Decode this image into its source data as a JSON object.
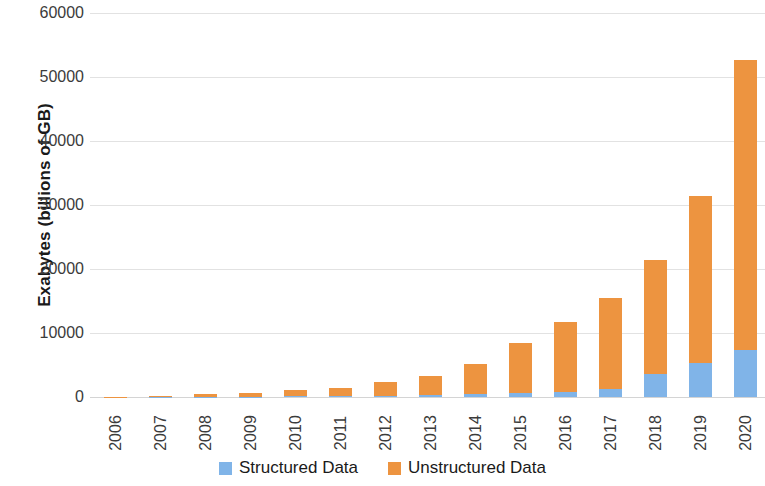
{
  "chart_data": {
    "type": "bar",
    "subtype": "stacked",
    "title": "",
    "xlabel": "",
    "ylabel": "Exabytes (billions of GB)",
    "categories": [
      "2006",
      "2007",
      "2008",
      "2009",
      "2010",
      "2011",
      "2012",
      "2013",
      "2014",
      "2015",
      "2016",
      "2017",
      "2018",
      "2019",
      "2020"
    ],
    "series": [
      {
        "name": "Structured Data",
        "color": "#80b4e8",
        "values": [
          10,
          25,
          50,
          80,
          120,
          170,
          230,
          300,
          400,
          550,
          800,
          1250,
          3600,
          5300,
          7400
        ]
      },
      {
        "name": "Unstructured Data",
        "color": "#ed9440",
        "values": [
          20,
          70,
          400,
          580,
          920,
          1230,
          2050,
          2930,
          4700,
          7950,
          10950,
          14250,
          17850,
          26150,
          45200
        ]
      }
    ],
    "totals": [
      30,
      95,
      450,
      660,
      1040,
      1400,
      2280,
      3230,
      5100,
      8500,
      11750,
      15500,
      21450,
      31450,
      52600
    ],
    "ylim": [
      0,
      60000
    ],
    "yticks": [
      0,
      10000,
      20000,
      30000,
      40000,
      50000,
      60000
    ],
    "ytick_labels": [
      "0",
      "10000",
      "20000",
      "30000",
      "40000",
      "50000",
      "60000"
    ],
    "grid": "horizontal",
    "legend_position": "bottom"
  },
  "legend": {
    "items": [
      {
        "label": "Structured Data",
        "color": "#80b4e8",
        "swatch": "legend-swatch-structured"
      },
      {
        "label": "Unstructured Data",
        "color": "#ed9440",
        "swatch": "legend-swatch-unstructured"
      }
    ]
  },
  "colors": {
    "structured": "#80b4e8",
    "unstructured": "#ed9440",
    "gridline": "#e2e2e2",
    "text": "#3b3b3b",
    "background": "#ffffff"
  }
}
